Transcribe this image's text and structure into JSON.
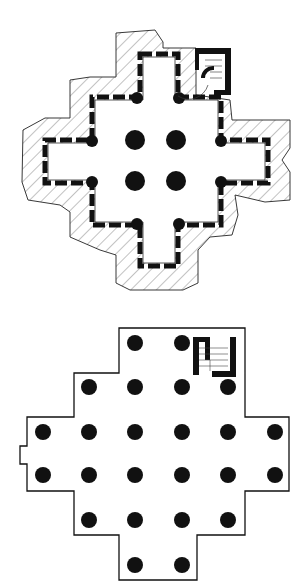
{
  "figure": {
    "background": "#ffffff",
    "ink": "#111111",
    "hatch": "#555555"
  },
  "plans": [
    {
      "id": "upper-plan",
      "description": "cross-shaped church plan with buttressed walls, hatched exterior and corner stair tower",
      "central_columns": [
        [
          135,
          140
        ],
        [
          182,
          140
        ],
        [
          135,
          182
        ],
        [
          182,
          182
        ]
      ],
      "column_radius": 10
    },
    {
      "id": "lower-plan",
      "description": "stepped cross-shaped hall plan with grid of columns and corner stair",
      "columns": [
        [
          135,
          343
        ],
        [
          182,
          343
        ],
        [
          89,
          387
        ],
        [
          135,
          387
        ],
        [
          182,
          387
        ],
        [
          228,
          387
        ],
        [
          43,
          432
        ],
        [
          89,
          432
        ],
        [
          135,
          432
        ],
        [
          182,
          432
        ],
        [
          228,
          432
        ],
        [
          275,
          432
        ],
        [
          43,
          475
        ],
        [
          89,
          475
        ],
        [
          135,
          475
        ],
        [
          182,
          475
        ],
        [
          228,
          475
        ],
        [
          275,
          475
        ],
        [
          89,
          520
        ],
        [
          135,
          520
        ],
        [
          182,
          520
        ],
        [
          228,
          520
        ],
        [
          135,
          565
        ],
        [
          182,
          565
        ]
      ],
      "column_radius": 8
    }
  ]
}
